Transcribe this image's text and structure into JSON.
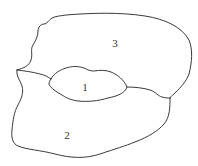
{
  "diagram": {
    "type": "region-map",
    "regions": [
      {
        "id": "1",
        "label": "1",
        "description": "central oval region"
      },
      {
        "id": "2",
        "label": "2",
        "description": "lower region"
      },
      {
        "id": "3",
        "label": "3",
        "description": "upper region"
      }
    ],
    "colors": {
      "stroke": "#3a3a3a",
      "background": "#ffffff",
      "label": "#333333"
    }
  }
}
